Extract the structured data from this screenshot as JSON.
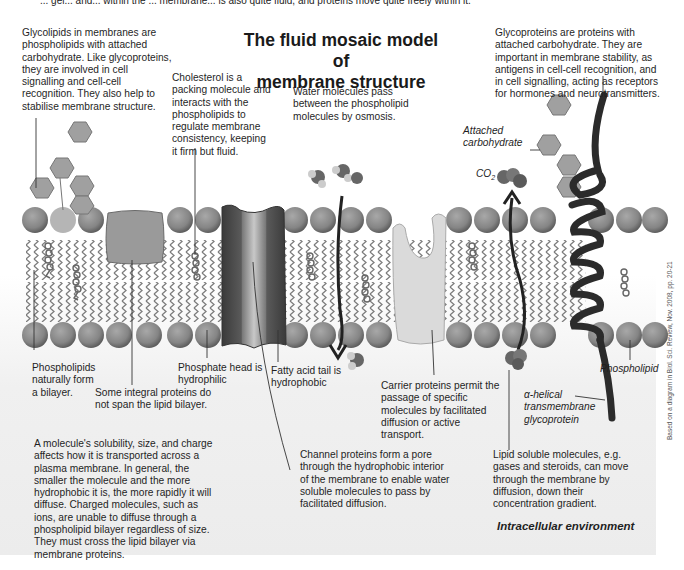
{
  "top_cutoff_text": "... gel... and... within the ... membrane... is also quite fluid, and proteins move quite freely within it.",
  "title_line1": "The fluid mosaic model of",
  "title_line2": "membrane structure",
  "annotations": {
    "glycolipids": "Glycolipids in membranes are phospholipids with attached carbohydrate. Like glycoproteins, they are involved in cell signalling and cell-cell recognition. They also help to stabilise membrane structure.",
    "cholesterol": "Cholesterol is a packing molecule and interacts with the phospholipids to regulate membrane consistency, keeping it firm but fluid.",
    "water": "Water molecules pass between the phospholipid molecules by osmosis.",
    "glycoproteins": "Glycoproteins are proteins with attached carbohydrate. They are important in membrane stability, as antigens in cell-cell recognition, and in cell signalling, acting as receptors for hormones and neurotransmitters.",
    "attached_carbohydrate": "Attached carbohydrate",
    "co2": "CO",
    "co2_sub": "2",
    "phospholipids_bilayer": "Phospholipids naturally form a bilayer.",
    "integral_proteins": "Some integral proteins do not span the lipid bilayer.",
    "phosphate_head": "Phosphate head is hydrophilic",
    "fatty_acid_tail": "Fatty acid tail is hydrophobic",
    "carrier_proteins": "Carrier proteins permit the passage of specific molecules by facilitated diffusion or active transport.",
    "phospholipid_label": "Phospholipid",
    "alpha_helical": "α-helical transmembrane glycoprotein",
    "solubility": "A molecule's solubility, size, and charge affects how it is transported across a plasma membrane. In general, the smaller the molecule and the more hydrophobic it is, the more rapidly it will diffuse. Charged molecules, such as ions, are unable to diffuse through a phospholipid bilayer regardless of size. They must cross the lipid bilayer via membrane proteins.",
    "channel_proteins": "Channel proteins form a pore through the hydrophobic interior of the membrane to enable water soluble molecules to pass by facilitated diffusion.",
    "lipid_soluble": "Lipid soluble molecules, e.g. gases and steroids, can move through the membrane by diffusion, down their concentration gradient.",
    "intracellular": "Intracellular environment"
  },
  "credit": "Based on a diagram in Biol. Sci. Review, Nov. 2008, pp. 20-21",
  "colors": {
    "head": "#8a8a8a",
    "head_dark": "#5e5e5e",
    "channel_outer": "#4a4a4a",
    "channel_inner": "#a9a9a9",
    "integral_protein": "#9a9a9a",
    "carrier_protein": "#d9d9d9",
    "helix": "#2b2b2b",
    "hexagon": "#a0a0a0"
  }
}
